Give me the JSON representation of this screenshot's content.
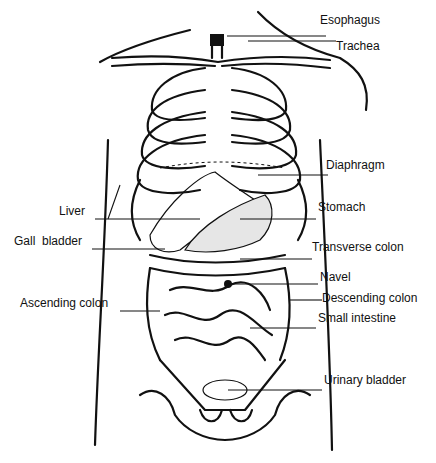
{
  "diagram": {
    "type": "anatomical-illustration",
    "labels": [
      {
        "id": "esophagus",
        "text": "Esophagus",
        "x": 320,
        "y": 13
      },
      {
        "id": "trachea",
        "text": "Trachea",
        "x": 336,
        "y": 39
      },
      {
        "id": "diaphragm",
        "text": "Diaphragm",
        "x": 326,
        "y": 158
      },
      {
        "id": "liver",
        "text": "Liver",
        "x": 59,
        "y": 204
      },
      {
        "id": "stomach",
        "text": "Stomach",
        "x": 318,
        "y": 200
      },
      {
        "id": "gall_bladder",
        "text": "Gall  bladder",
        "x": 14,
        "y": 234
      },
      {
        "id": "transverse_colon",
        "text": "Transverse colon",
        "x": 312,
        "y": 240
      },
      {
        "id": "navel",
        "text": "Navel",
        "x": 320,
        "y": 270
      },
      {
        "id": "ascending_colon",
        "text": "Ascending colon",
        "x": 20,
        "y": 296
      },
      {
        "id": "descending_colon",
        "text": "Descending colon",
        "x": 322,
        "y": 291
      },
      {
        "id": "small_intestine",
        "text": "Small intestine",
        "x": 318,
        "y": 311
      },
      {
        "id": "urinary_bladder",
        "text": "Urinary bladder",
        "x": 324,
        "y": 373
      }
    ]
  }
}
